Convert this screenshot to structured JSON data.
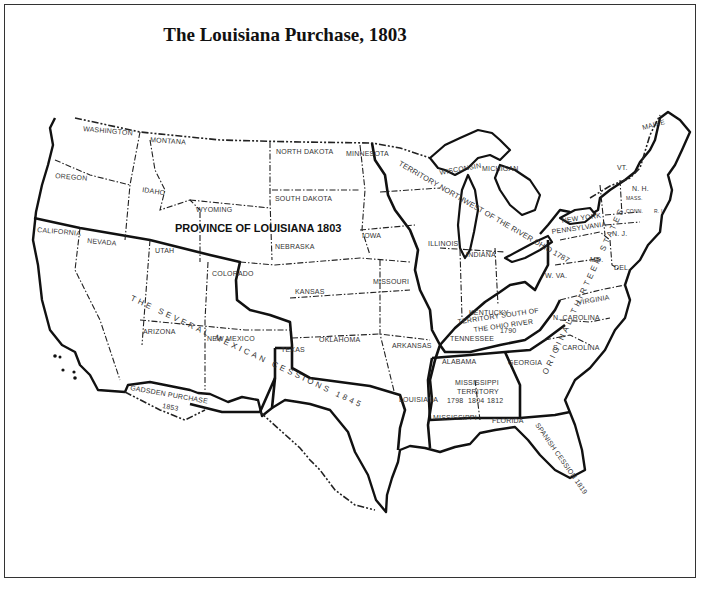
{
  "title": "The Louisiana Purchase, 1803",
  "map": {
    "primary_region": "PROVINCE OF LOUISIANA 1803",
    "cessions": {
      "mexican": "THE SEVERAL MEXICAN CESSIONS 1845",
      "gadsden_line1": "GADSDEN PURCHASE",
      "gadsden_line2": "1853",
      "spanish": "SPANISH CESSION 1819",
      "thirteen": "ORIGINAL THIRTEEN STATES",
      "northwest": "TERRITORY NORTHWEST OF THE RIVER OHIO 1787",
      "south_of_ohio_line1": "KENTUCKY",
      "south_of_ohio_line2": "TERRITORY SOUTH OF",
      "south_of_ohio_line3": "THE OHIO RIVER",
      "south_of_ohio_line4": "TENNESSEE",
      "south_of_ohio_year": "1790",
      "mississippi_line1": "MISSISSIPPI",
      "mississippi_line2": "TERRITORY",
      "mississippi_years": [
        "1798",
        "1804",
        "1812"
      ]
    },
    "states": {
      "washington": "WASHINGTON",
      "oregon": "OREGON",
      "california": "CALIFORNIA",
      "nevada": "NEVADA",
      "idaho": "IDAHO",
      "montana": "MONTANA",
      "wyoming": "WYOMING",
      "utah": "UTAH",
      "arizona": "ARIZONA",
      "colorado": "COLORADO",
      "new_mexico": "NEW MEXICO",
      "north_dakota": "NORTH DAKOTA",
      "south_dakota": "SOUTH DAKOTA",
      "nebraska": "NEBRASKA",
      "kansas": "KANSAS",
      "oklahoma": "OKLAHOMA",
      "texas": "TEXAS",
      "minnesota": "MINNESOTA",
      "iowa": "IOWA",
      "missouri": "MISSOURI",
      "arkansas": "ARKANSAS",
      "louisiana": "LOUISIANA",
      "wisconsin": "WISCONSIN",
      "michigan": "MICHIGAN",
      "illinois": "ILLINOIS",
      "indiana": "INDIANA",
      "ohio": "OHIO",
      "alabama": "ALABAMA",
      "mississippi": "MISSISSIPPI",
      "georgia": "GEORGIA",
      "florida": "FLORIDA",
      "south_carolina": "S. CAROLINA",
      "north_carolina": "N. CAROLINA",
      "virginia": "VIRGINIA",
      "west_virginia": "W. VA.",
      "maryland": "MD.",
      "delaware": "DEL.",
      "pennsylvania": "PENNSYLVANIA",
      "new_york": "NEW YORK",
      "new_jersey": "N. J.",
      "vermont": "VT.",
      "new_hampshire": "N. H.",
      "massachusetts": "MASS.",
      "connecticut": "CONN.",
      "rhode_island": "R. I.",
      "maine": "MAINE"
    }
  }
}
